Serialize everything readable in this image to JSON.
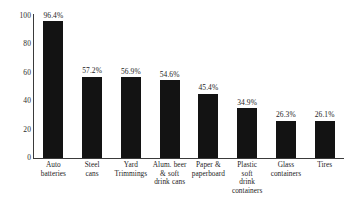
{
  "chart_data": {
    "type": "bar",
    "title": "",
    "subtitle": "",
    "xlabel": "",
    "ylabel": "",
    "ylim": [
      0,
      100
    ],
    "yticks": [
      "0",
      "20",
      "40",
      "60",
      "80",
      "100"
    ],
    "grid": false,
    "legend": false,
    "bar_color": "#131313",
    "axis_color": "#3a3a3a",
    "categories": [
      "Auto batteries",
      "Steel cans",
      "Yard Trimmings",
      "Alum. beer & soft drink cans",
      "Paper & paperboard",
      "Plastic soft drink containers",
      "Glass containers",
      "Tires"
    ],
    "category_lines": [
      [
        "Auto",
        "batteries"
      ],
      [
        "Steel",
        "cans"
      ],
      [
        "Yard",
        "Trimmings"
      ],
      [
        "Alum. beer",
        "& soft",
        "drink cans"
      ],
      [
        "Paper &",
        "paperboard"
      ],
      [
        "Plastic",
        "soft",
        "drink",
        "containers"
      ],
      [
        "Glass",
        "containers"
      ],
      [
        "Tires"
      ]
    ],
    "values": [
      96.4,
      57.2,
      56.9,
      54.6,
      45.4,
      34.9,
      26.3,
      26.1
    ],
    "value_labels": [
      "96.4%",
      "57.2%",
      "56.9%",
      "54.6%",
      "45.4%",
      "34.9%",
      "26.3%",
      "26.1%"
    ]
  }
}
